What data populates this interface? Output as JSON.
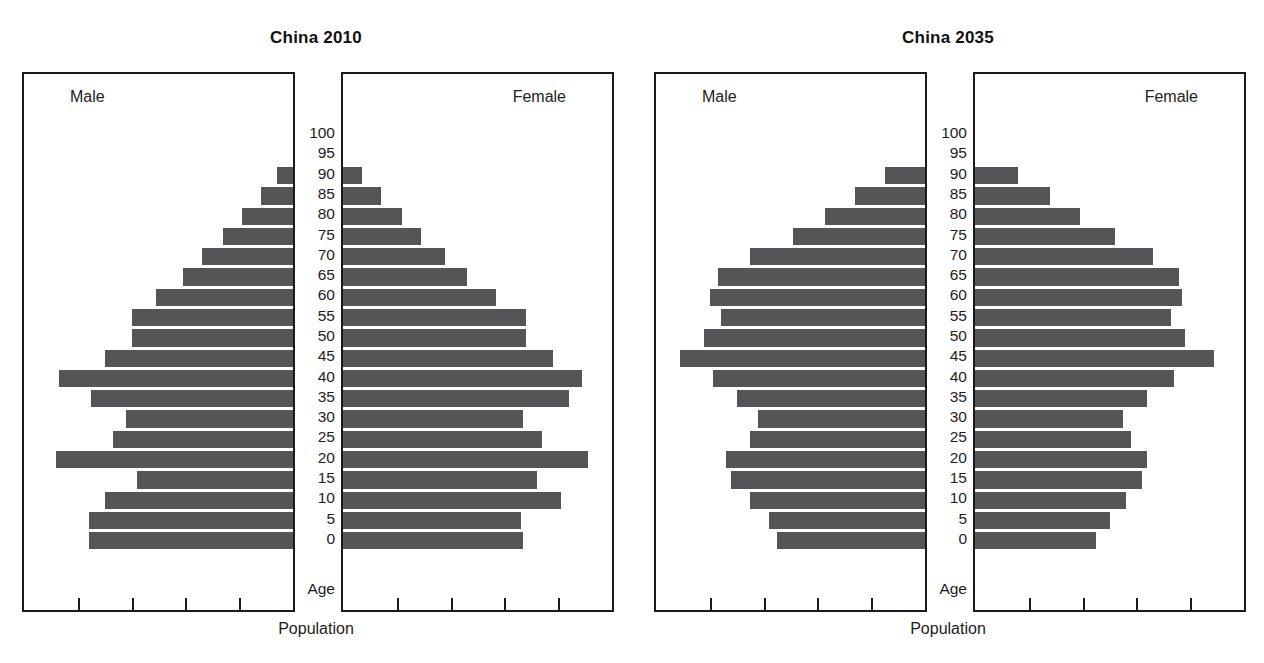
{
  "page": {
    "background": "#ffffff",
    "bar_color": "#555558",
    "axis_color": "#1b1b1b"
  },
  "figures": [
    {
      "id": "figure-2010",
      "title": "China 2010",
      "male_label": "Male",
      "female_label": "Female",
      "age_axis_caption": "Age",
      "x_axis_caption": "Population"
    },
    {
      "id": "figure-2035",
      "title": "China 2035",
      "male_label": "Male",
      "female_label": "Female",
      "age_axis_caption": "Age",
      "x_axis_caption": "Population"
    }
  ],
  "age_labels": [
    "100",
    "95",
    "90",
    "85",
    "80",
    "75",
    "70",
    "65",
    "60",
    "55",
    "50",
    "45",
    "40",
    "35",
    "30",
    "25",
    "20",
    "15",
    "10",
    "5",
    "0"
  ],
  "chart_data": [
    {
      "type": "bar",
      "title": "China 2010",
      "subtitle": "",
      "orientation": "population-pyramid",
      "xlabel": "Population",
      "ylabel": "Age",
      "legend": [
        "Male",
        "Female"
      ],
      "legend_position": "inside-panel-top",
      "grid": false,
      "axis_ranges": {
        "x": [
          0,
          100
        ],
        "y_age": [
          0,
          100
        ]
      },
      "x_tick_count": 4,
      "x_tick_labels": [],
      "categories": [
        "0",
        "5",
        "10",
        "15",
        "20",
        "25",
        "30",
        "35",
        "40",
        "45",
        "50",
        "55",
        "60",
        "65",
        "70",
        "75",
        "80",
        "85",
        "90",
        "95",
        "100"
      ],
      "series": [
        {
          "name": "Male",
          "side": "left",
          "values": [
            76,
            76,
            70,
            58,
            88,
            67,
            62,
            75,
            87,
            70,
            60,
            60,
            51,
            41,
            34,
            26,
            19,
            12,
            6,
            0,
            0
          ]
        },
        {
          "name": "Female",
          "side": "right",
          "values": [
            67,
            66,
            81,
            72,
            91,
            74,
            67,
            84,
            89,
            78,
            68,
            68,
            57,
            46,
            38,
            29,
            22,
            14,
            7,
            0,
            0
          ]
        }
      ],
      "value_units": "percent of panel width (relative population)"
    },
    {
      "type": "bar",
      "title": "China 2035",
      "subtitle": "",
      "orientation": "population-pyramid",
      "xlabel": "Population",
      "ylabel": "Age",
      "legend": [
        "Male",
        "Female"
      ],
      "legend_position": "inside-panel-top",
      "grid": false,
      "axis_ranges": {
        "x": [
          0,
          100
        ],
        "y_age": [
          0,
          100
        ]
      },
      "x_tick_count": 4,
      "x_tick_labels": [],
      "categories": [
        "0",
        "5",
        "10",
        "15",
        "20",
        "25",
        "30",
        "35",
        "40",
        "45",
        "50",
        "55",
        "60",
        "65",
        "70",
        "75",
        "80",
        "85",
        "90",
        "95",
        "100"
      ],
      "series": [
        {
          "name": "Male",
          "side": "left",
          "values": [
            55,
            58,
            65,
            72,
            74,
            65,
            62,
            70,
            79,
            91,
            82,
            76,
            80,
            77,
            65,
            49,
            37,
            26,
            15,
            0,
            0
          ]
        },
        {
          "name": "Female",
          "side": "right",
          "values": [
            45,
            50,
            56,
            62,
            64,
            58,
            55,
            64,
            74,
            89,
            78,
            73,
            77,
            76,
            66,
            52,
            39,
            28,
            16,
            0,
            0
          ]
        }
      ],
      "value_units": "percent of panel width (relative population)"
    }
  ]
}
